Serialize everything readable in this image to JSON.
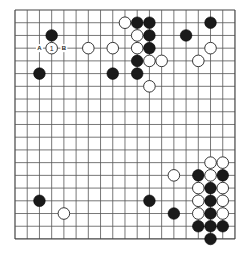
{
  "board": {
    "size": 19,
    "origin_x": 15,
    "origin_y": 10,
    "spacing_x": 12.22,
    "spacing_y": 12.72,
    "stone_radius": 5.8,
    "colors": {
      "line": "#555555",
      "black": "#1a1a1a",
      "white": "#ffffff",
      "background": "#ffffff"
    }
  },
  "stones": [
    {
      "color": "white",
      "col": 9,
      "row": 1
    },
    {
      "color": "black",
      "col": 10,
      "row": 1
    },
    {
      "color": "black",
      "col": 11,
      "row": 1
    },
    {
      "color": "black",
      "col": 16,
      "row": 1
    },
    {
      "color": "black",
      "col": 3,
      "row": 2
    },
    {
      "color": "white",
      "col": 10,
      "row": 2
    },
    {
      "color": "black",
      "col": 11,
      "row": 2
    },
    {
      "color": "black",
      "col": 14,
      "row": 2
    },
    {
      "color": "white",
      "col": 3,
      "row": 3,
      "label": "1"
    },
    {
      "color": "white",
      "col": 6,
      "row": 3
    },
    {
      "color": "white",
      "col": 8,
      "row": 3
    },
    {
      "color": "white",
      "col": 10,
      "row": 3
    },
    {
      "color": "black",
      "col": 11,
      "row": 3
    },
    {
      "color": "white",
      "col": 16,
      "row": 3
    },
    {
      "color": "black",
      "col": 10,
      "row": 4
    },
    {
      "color": "white",
      "col": 11,
      "row": 4
    },
    {
      "color": "white",
      "col": 12,
      "row": 4
    },
    {
      "color": "white",
      "col": 15,
      "row": 4
    },
    {
      "color": "black",
      "col": 2,
      "row": 5
    },
    {
      "color": "black",
      "col": 8,
      "row": 5
    },
    {
      "color": "black",
      "col": 10,
      "row": 5
    },
    {
      "color": "white",
      "col": 11,
      "row": 6
    },
    {
      "color": "white",
      "col": 16,
      "row": 12
    },
    {
      "color": "white",
      "col": 17,
      "row": 12
    },
    {
      "color": "white",
      "col": 13,
      "row": 13
    },
    {
      "color": "black",
      "col": 15,
      "row": 13
    },
    {
      "color": "white",
      "col": 16,
      "row": 13
    },
    {
      "color": "black",
      "col": 17,
      "row": 13
    },
    {
      "color": "white",
      "col": 15,
      "row": 14
    },
    {
      "color": "black",
      "col": 16,
      "row": 14
    },
    {
      "color": "white",
      "col": 17,
      "row": 14
    },
    {
      "color": "black",
      "col": 2,
      "row": 15
    },
    {
      "color": "black",
      "col": 11,
      "row": 15
    },
    {
      "color": "white",
      "col": 15,
      "row": 15
    },
    {
      "color": "black",
      "col": 16,
      "row": 15
    },
    {
      "color": "white",
      "col": 17,
      "row": 15
    },
    {
      "color": "white",
      "col": 4,
      "row": 16
    },
    {
      "color": "black",
      "col": 13,
      "row": 16
    },
    {
      "color": "white",
      "col": 15,
      "row": 16
    },
    {
      "color": "black",
      "col": 16,
      "row": 16
    },
    {
      "color": "white",
      "col": 17,
      "row": 16
    },
    {
      "color": "black",
      "col": 15,
      "row": 17
    },
    {
      "color": "black",
      "col": 16,
      "row": 17
    },
    {
      "color": "black",
      "col": 17,
      "row": 17
    },
    {
      "color": "black",
      "col": 16,
      "row": 18
    }
  ],
  "point_labels": [
    {
      "text": "A",
      "col": 2,
      "row": 3
    },
    {
      "text": "B",
      "col": 4,
      "row": 3
    }
  ]
}
